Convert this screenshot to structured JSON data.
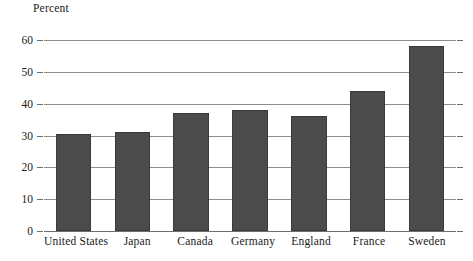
{
  "chart_data": {
    "type": "bar",
    "title": "",
    "subtitle": "",
    "xlabel": "",
    "ylabel": "Percent",
    "categories": [
      "United States",
      "Japan",
      "Canada",
      "Germany",
      "England",
      "France",
      "Sweden"
    ],
    "values": [
      30.5,
      31,
      37,
      38,
      36,
      44,
      58
    ],
    "series": [
      {
        "name": "Percent",
        "values": [
          30.5,
          31,
          37,
          38,
          36,
          44,
          58
        ]
      }
    ],
    "ylim": [
      0,
      60
    ],
    "ytick_labels": [
      "60",
      "50",
      "40",
      "30",
      "20",
      "10",
      "0"
    ],
    "ytick_values": [
      60,
      50,
      40,
      30,
      20,
      10,
      0
    ],
    "grid": "horizontal",
    "legend": "none",
    "bar_color": "#4b4b4b",
    "gridline_color": "#8d8d8d",
    "text_color": "#1a1a1a",
    "background": "#ffffff"
  }
}
